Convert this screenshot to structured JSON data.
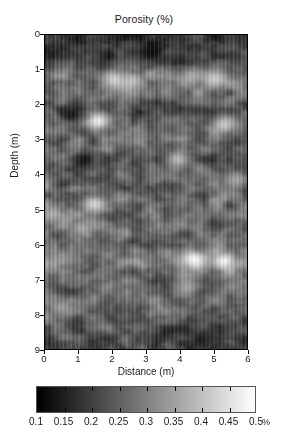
{
  "figure": {
    "title": "Porosity (%)",
    "background": "#ffffff",
    "colormap": "gray"
  },
  "axes": {
    "xlabel": "Distance (m)",
    "ylabel": "Depth (m)",
    "xticks": [
      "0",
      "1",
      "2",
      "3",
      "4",
      "5",
      "6"
    ],
    "yticks": [
      "0",
      "1",
      "2",
      "3",
      "4",
      "5",
      "6",
      "7",
      "8",
      "9"
    ]
  },
  "colorbar": {
    "ticklabels": [
      "0.1",
      "0.15",
      "0.2",
      "0.25",
      "0.3",
      "0.35",
      "0.4",
      "0.45",
      "0.5"
    ],
    "unit": "%",
    "low_color": "#000000",
    "high_color": "#ffffff",
    "orientation": "horizontal"
  },
  "chart_data": {
    "type": "heatmap",
    "title": "Porosity (%)",
    "xlabel": "Distance (m)",
    "ylabel": "Depth (m)",
    "xlim": [
      0,
      6
    ],
    "ylim": [
      9,
      0
    ],
    "y_axis_inverted": true,
    "grid": false,
    "legend": "colorbar-below",
    "colormap": "grayscale",
    "value_unit": "%",
    "vmin": 0.1,
    "vmax": 0.5,
    "colorbar_ticks": [
      0.1,
      0.15,
      0.2,
      0.25,
      0.3,
      0.35,
      0.4,
      0.45,
      0.5
    ],
    "xticks": [
      0,
      1,
      2,
      3,
      4,
      5,
      6
    ],
    "yticks": [
      0,
      1,
      2,
      3,
      4,
      5,
      6,
      7,
      8,
      9
    ],
    "grid_nx": 68,
    "grid_ny": 104,
    "x_coords": [
      0.0,
      0.088,
      0.176,
      0.265,
      0.353,
      0.441,
      0.529,
      0.618,
      0.706,
      0.794,
      0.882,
      0.971,
      1.059,
      1.147,
      1.235,
      1.324,
      1.412,
      1.5,
      1.588,
      1.676,
      1.765,
      1.853,
      1.941,
      2.029,
      2.118,
      2.206,
      2.294,
      2.382,
      2.471,
      2.559,
      2.647,
      2.735,
      2.824,
      2.912,
      3.0,
      3.088,
      3.176,
      3.265,
      3.353,
      3.441,
      3.529,
      3.618,
      3.706,
      3.794,
      3.882,
      3.971,
      4.059,
      4.147,
      4.235,
      4.324,
      4.412,
      4.5,
      4.588,
      4.676,
      4.765,
      4.853,
      4.941,
      5.029,
      5.118,
      5.206,
      5.294,
      5.382,
      5.471,
      5.559,
      5.647,
      5.735,
      5.824,
      6.0
    ],
    "layer_profile": [
      {
        "depth_m": 0.0,
        "mean_porosity": 0.175,
        "note": "dark low-porosity cap"
      },
      {
        "depth_m": 0.3,
        "mean_porosity": 0.185
      },
      {
        "depth_m": 0.6,
        "mean_porosity": 0.2
      },
      {
        "depth_m": 0.9,
        "mean_porosity": 0.255
      },
      {
        "depth_m": 1.2,
        "mean_porosity": 0.3,
        "note": "bright layer with anomalies"
      },
      {
        "depth_m": 1.5,
        "mean_porosity": 0.285
      },
      {
        "depth_m": 1.8,
        "mean_porosity": 0.275
      },
      {
        "depth_m": 2.1,
        "mean_porosity": 0.215,
        "note": "dark band"
      },
      {
        "depth_m": 2.4,
        "mean_porosity": 0.26
      },
      {
        "depth_m": 2.7,
        "mean_porosity": 0.285
      },
      {
        "depth_m": 3.0,
        "mean_porosity": 0.27
      },
      {
        "depth_m": 3.3,
        "mean_porosity": 0.25
      },
      {
        "depth_m": 3.6,
        "mean_porosity": 0.235,
        "note": "dark patch left of 2 m"
      },
      {
        "depth_m": 3.9,
        "mean_porosity": 0.255
      },
      {
        "depth_m": 4.2,
        "mean_porosity": 0.265
      },
      {
        "depth_m": 4.5,
        "mean_porosity": 0.26
      },
      {
        "depth_m": 4.8,
        "mean_porosity": 0.27
      },
      {
        "depth_m": 5.1,
        "mean_porosity": 0.265
      },
      {
        "depth_m": 5.4,
        "mean_porosity": 0.275
      },
      {
        "depth_m": 5.7,
        "mean_porosity": 0.28
      },
      {
        "depth_m": 6.0,
        "mean_porosity": 0.27
      },
      {
        "depth_m": 6.3,
        "mean_porosity": 0.285
      },
      {
        "depth_m": 6.6,
        "mean_porosity": 0.3,
        "note": "bright anomalies near 4-5 m"
      },
      {
        "depth_m": 6.9,
        "mean_porosity": 0.275
      },
      {
        "depth_m": 7.2,
        "mean_porosity": 0.265
      },
      {
        "depth_m": 7.5,
        "mean_porosity": 0.27
      },
      {
        "depth_m": 7.8,
        "mean_porosity": 0.28
      },
      {
        "depth_m": 8.1,
        "mean_porosity": 0.265
      },
      {
        "depth_m": 8.4,
        "mean_porosity": 0.24
      },
      {
        "depth_m": 8.7,
        "mean_porosity": 0.225
      },
      {
        "depth_m": 9.0,
        "mean_porosity": 0.215,
        "note": "darker base"
      }
    ],
    "bright_anomalies": [
      {
        "x_m": 1.55,
        "depth_m": 2.45,
        "porosity": 0.48
      },
      {
        "x_m": 2.05,
        "depth_m": 1.25,
        "porosity": 0.44
      },
      {
        "x_m": 2.55,
        "depth_m": 1.3,
        "porosity": 0.41
      },
      {
        "x_m": 5.05,
        "depth_m": 1.22,
        "porosity": 0.43
      },
      {
        "x_m": 4.35,
        "depth_m": 1.18,
        "porosity": 0.38
      },
      {
        "x_m": 5.35,
        "depth_m": 2.55,
        "porosity": 0.42
      },
      {
        "x_m": 3.95,
        "depth_m": 3.55,
        "porosity": 0.4
      },
      {
        "x_m": 1.45,
        "depth_m": 4.85,
        "porosity": 0.44
      },
      {
        "x_m": 4.45,
        "depth_m": 6.45,
        "porosity": 0.5
      },
      {
        "x_m": 5.35,
        "depth_m": 6.5,
        "porosity": 0.49
      },
      {
        "x_m": 1.05,
        "depth_m": 5.55,
        "porosity": 0.37
      },
      {
        "x_m": 4.25,
        "depth_m": 7.25,
        "porosity": 0.36
      },
      {
        "x_m": 0.45,
        "depth_m": 7.85,
        "porosity": 0.35
      },
      {
        "x_m": 5.75,
        "depth_m": 4.15,
        "porosity": 0.36
      },
      {
        "x_m": 0.15,
        "depth_m": 5.15,
        "porosity": 0.38
      }
    ],
    "dark_anomalies": [
      {
        "x_m": 1.15,
        "depth_m": 3.55,
        "porosity": 0.13
      },
      {
        "x_m": 0.75,
        "depth_m": 2.25,
        "porosity": 0.14
      },
      {
        "x_m": 3.15,
        "depth_m": 0.45,
        "porosity": 0.12
      },
      {
        "x_m": 4.65,
        "depth_m": 8.75,
        "porosity": 0.14
      }
    ]
  }
}
